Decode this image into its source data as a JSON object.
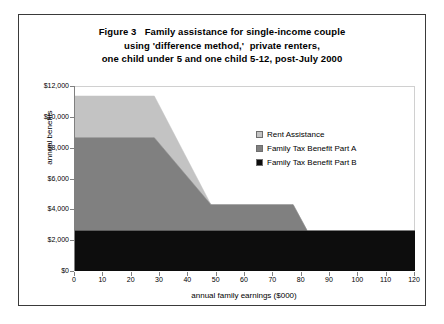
{
  "title_lines": [
    "Figure 3   Family assistance for single-income couple",
    "using 'difference method,'  private renters,",
    "one child under 5 and one child 5-12, post-July 2000"
  ],
  "colors": {
    "rent_assistance": "#c3c3c3",
    "ftb_part_a": "#808080",
    "ftb_part_b": "#0d0d0d",
    "axis": "#808080",
    "frame": "#3a3a3a",
    "plot_background": "#ffffff"
  },
  "chart_data": {
    "type": "area",
    "title": "Figure 3   Family assistance for single-income couple using 'difference method,'  private renters, one child under 5 and one child 5-12, post-July 2000",
    "xlabel": "annual family earnings ($000)",
    "ylabel": "annual benefits",
    "xlim": [
      0,
      120
    ],
    "ylim": [
      0,
      12000
    ],
    "xticks": [
      0,
      10,
      20,
      30,
      40,
      50,
      60,
      70,
      80,
      90,
      100,
      110,
      120
    ],
    "yticks": [
      0,
      2000,
      4000,
      6000,
      8000,
      10000,
      12000
    ],
    "ytick_labels": [
      "$0",
      "$2,000",
      "$4,000",
      "$6,000",
      "$8,000",
      "$10,000",
      "$12,000"
    ],
    "xtick_labels": [
      "0",
      "10",
      "20",
      "30",
      "40",
      "50",
      "60",
      "70",
      "80",
      "90",
      "100",
      "110",
      "120"
    ],
    "grid": false,
    "stacked": true,
    "legend_position": "inside-right",
    "x": [
      0,
      28,
      48,
      77,
      82,
      120
    ],
    "series": [
      {
        "name": "Family Tax Benefit Part B",
        "color": "#0d0d0d",
        "values": [
          2600,
          2600,
          2600,
          2600,
          2600,
          2600
        ]
      },
      {
        "name": "Family Tax Benefit Part A",
        "color": "#808080",
        "values": [
          6050,
          6050,
          1700,
          1700,
          0,
          0
        ]
      },
      {
        "name": "Rent Assistance",
        "color": "#c3c3c3",
        "values": [
          2700,
          2700,
          0,
          0,
          0,
          0
        ]
      }
    ],
    "cumulative_tops": {
      "ftb_part_b": [
        2600,
        2600,
        2600,
        2600,
        2600,
        2600
      ],
      "ftb_part_a": [
        8650,
        8650,
        4300,
        4300,
        2600,
        2600
      ],
      "rent_assistance": [
        11350,
        11350,
        4300,
        4300,
        2600,
        2600
      ]
    }
  },
  "legend": {
    "items": [
      {
        "label": "Rent Assistance",
        "color": "#c3c3c3"
      },
      {
        "label": "Family Tax Benefit Part A",
        "color": "#808080"
      },
      {
        "label": "Family Tax Benefit Part B",
        "color": "#0d0d0d"
      }
    ]
  }
}
